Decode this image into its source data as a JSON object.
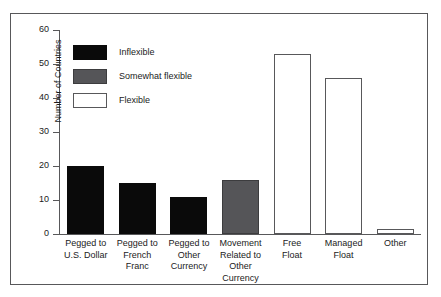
{
  "chart_data": {
    "type": "bar",
    "title": "",
    "xlabel": "",
    "ylabel": "Number of Countries",
    "ylim": [
      0,
      60
    ],
    "yticks": [
      0,
      10,
      20,
      30,
      40,
      50,
      60
    ],
    "grid": false,
    "legend_position": "upper-left-inside",
    "categories": [
      "Pegged to U.S. Dollar",
      "Pegged to French Franc",
      "Pegged to Other Currency",
      "Movement Related to Other Currency",
      "Free Float",
      "Managed Float",
      "Other"
    ],
    "category_lines": [
      [
        "Pegged to",
        "U.S. Dollar"
      ],
      [
        "Pegged to",
        "French Franc"
      ],
      [
        "Pegged to",
        "Other",
        "Currency"
      ],
      [
        "Movement",
        "Related to",
        "Other Currency"
      ],
      [
        "Free",
        "Float"
      ],
      [
        "Managed",
        "Float"
      ],
      [
        "Other"
      ]
    ],
    "values": [
      20,
      15,
      11,
      16,
      53,
      46,
      1.5
    ],
    "bar_groups": [
      "inflexible",
      "inflexible",
      "inflexible",
      "somewhat",
      "flexible",
      "flexible",
      "flexible"
    ],
    "legend": [
      {
        "key": "inflexible",
        "label": "Inflexible",
        "color": "#0a0a0a"
      },
      {
        "key": "somewhat",
        "label": "Somewhat flexible",
        "color": "#555558"
      },
      {
        "key": "flexible",
        "label": "Flexible",
        "color": "#ffffff"
      }
    ]
  },
  "colors": {
    "inflexible": "#0a0a0a",
    "somewhat_flexible": "#555558",
    "flexible": "#ffffff",
    "axis": "#58585a",
    "text": "#1b1b1b",
    "background": "#ffffff"
  }
}
